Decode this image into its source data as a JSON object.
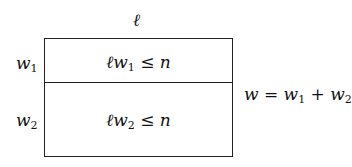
{
  "diagram": {
    "top_label": "ℓ",
    "row_labels": [
      {
        "var": "w",
        "sub": "1"
      },
      {
        "var": "w",
        "sub": "2"
      }
    ],
    "cells": [
      {
        "prefix": "ℓw",
        "sub": "1",
        "rel": " ≤ n"
      },
      {
        "prefix": "ℓw",
        "sub": "2",
        "rel": " ≤ n"
      }
    ],
    "side_equation": {
      "lhs": "w = w",
      "sub1": "1",
      "mid": " + w",
      "sub2": "2"
    }
  }
}
